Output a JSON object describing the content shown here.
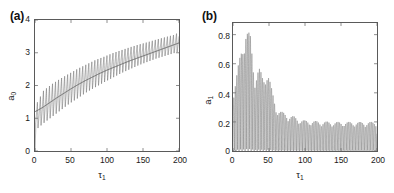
{
  "figure": {
    "background": "#ffffff",
    "line_color": "#6b6b6b",
    "mean_line_color": "#5a5a5a",
    "axis_color": "#5a5a5a"
  },
  "panels": [
    {
      "tag": "(a)",
      "xlabel_main": "τ",
      "xlabel_sub": "1",
      "ylabel_main": "a",
      "ylabel_sub": "0",
      "xticks": [
        "0",
        "50",
        "100",
        "150",
        "200"
      ],
      "yticks": [
        "0",
        "1",
        "2",
        "3",
        "4"
      ]
    },
    {
      "tag": "(b)",
      "xlabel_main": "τ",
      "xlabel_sub": "1",
      "ylabel_main": "a",
      "ylabel_sub": "1",
      "xticks": [
        "0",
        "50",
        "100",
        "150",
        "200"
      ],
      "yticks": [
        "0",
        "0.2",
        "0.4",
        "0.6",
        "0.8"
      ]
    }
  ],
  "chart_data": [
    {
      "type": "line",
      "panel": "(a)",
      "title": "",
      "xlabel": "τ₁",
      "ylabel": "a₀",
      "xlim": [
        0,
        200
      ],
      "ylim": [
        0,
        4
      ],
      "xticks": [
        0,
        50,
        100,
        150,
        200
      ],
      "yticks": [
        0,
        1,
        2,
        3,
        4
      ],
      "grid": false,
      "legend": "none",
      "series": [
        {
          "name": "oscillating amplitude a0",
          "description": "sawtooth oscillation about a slowly rising mean, amplitude grows from about 0.5 to 0.55 as tau1 increases",
          "oscillation_period": 4.2,
          "envelope_low": [
            0.62,
            0.85,
            1.05,
            1.25,
            1.45,
            1.62,
            1.8,
            1.95,
            2.1,
            2.24,
            2.38,
            2.5,
            2.62,
            2.72,
            2.82,
            2.9,
            2.98,
            3.04
          ],
          "envelope_high": [
            1.35,
            1.85,
            2.05,
            2.22,
            2.37,
            2.52,
            2.65,
            2.78,
            2.88,
            2.99,
            3.08,
            3.17,
            3.25,
            3.32,
            3.4,
            3.47,
            3.54,
            3.62
          ],
          "x_envelope": [
            0,
            12,
            24,
            36,
            48,
            60,
            72,
            84,
            96,
            108,
            120,
            132,
            144,
            156,
            168,
            180,
            192,
            200
          ]
        },
        {
          "name": "mean curve a0",
          "description": "smooth monotonically increasing curve",
          "x": [
            0,
            10,
            20,
            30,
            40,
            50,
            60,
            70,
            80,
            90,
            100,
            110,
            120,
            130,
            140,
            150,
            160,
            170,
            180,
            190,
            200
          ],
          "y": [
            1.2,
            1.32,
            1.47,
            1.62,
            1.76,
            1.9,
            2.03,
            2.15,
            2.26,
            2.37,
            2.47,
            2.56,
            2.65,
            2.74,
            2.82,
            2.9,
            2.98,
            3.06,
            3.14,
            3.22,
            3.3
          ]
        }
      ]
    },
    {
      "type": "line",
      "panel": "(b)",
      "title": "",
      "xlabel": "τ₁",
      "ylabel": "a₁",
      "xlim": [
        0,
        200
      ],
      "ylim": [
        0,
        0.88
      ],
      "xticks": [
        0,
        50,
        100,
        150,
        200
      ],
      "yticks": [
        0,
        0.2,
        0.4,
        0.6,
        0.8
      ],
      "grid": false,
      "legend": "none",
      "series": [
        {
          "name": "oscillating amplitude a1",
          "description": "dense fast oscillation whose envelope rises to a peak near tau1=18 then decays in bursts and settles to a steady band of about 0.2",
          "fast_period": 2.1,
          "x_envelope": [
            0,
            6,
            12,
            18,
            24,
            30,
            36,
            42,
            48,
            54,
            60,
            68,
            76,
            84,
            92,
            100,
            120,
            140,
            160,
            180,
            200
          ],
          "envelope_high": [
            0.4,
            0.55,
            0.72,
            0.85,
            0.8,
            0.52,
            0.58,
            0.5,
            0.57,
            0.42,
            0.3,
            0.27,
            0.25,
            0.24,
            0.22,
            0.21,
            0.205,
            0.2,
            0.2,
            0.2,
            0.2
          ],
          "envelope_low": [
            0.0,
            0.0,
            0.0,
            0.0,
            0.0,
            0.0,
            0.0,
            0.0,
            0.0,
            0.0,
            0.0,
            0.0,
            0.0,
            0.0,
            0.0,
            0.0,
            0.0,
            0.0,
            0.0,
            0.0,
            0.0
          ],
          "peak_value": 0.85,
          "peak_x": 18,
          "steady_value": 0.2
        }
      ]
    }
  ]
}
